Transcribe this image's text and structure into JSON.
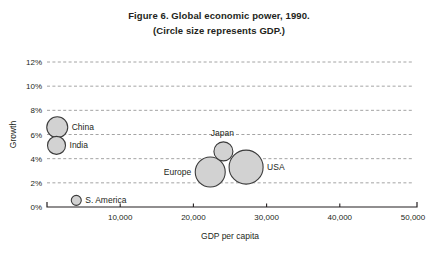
{
  "figure": {
    "title_line1": "Figure 6. Global economic power, 1990.",
    "title_line2": "(Circle size represents GDP.)"
  },
  "chart_data": {
    "type": "scatter",
    "title": "Figure 6. Global economic power, 1990. (Circle size represents GDP.)",
    "xlabel": "GDP per capita",
    "ylabel": "Growth",
    "xlim": [
      0,
      50000
    ],
    "ylim": [
      0,
      12
    ],
    "xticks": [
      0,
      10000,
      20000,
      30000,
      40000,
      50000
    ],
    "xtick_labels": [
      "",
      "10,000",
      "20,000",
      "30,000",
      "40,000",
      "50,000"
    ],
    "yticks": [
      0,
      2,
      4,
      6,
      8,
      10,
      12
    ],
    "ytick_labels": [
      "0%",
      "2%",
      "4%",
      "6%",
      "8%",
      "10%",
      "12%"
    ],
    "grid": "horizontal-dashed",
    "legend": "none",
    "size_meaning": "Circle size represents GDP",
    "points": [
      {
        "name": "China",
        "x": 1400,
        "y": 6.6,
        "size": 10.5,
        "label_pos": "right"
      },
      {
        "name": "India",
        "x": 1300,
        "y": 5.1,
        "size": 9.0,
        "label_pos": "right"
      },
      {
        "name": "S. America",
        "x": 4000,
        "y": 0.55,
        "size": 5.0,
        "label_pos": "right"
      },
      {
        "name": "Europe",
        "x": 22300,
        "y": 2.9,
        "size": 15.0,
        "label_pos": "left"
      },
      {
        "name": "Japan",
        "x": 24100,
        "y": 4.6,
        "size": 9.5,
        "label_pos": "above"
      },
      {
        "name": "USA",
        "x": 27200,
        "y": 3.3,
        "size": 17.0,
        "label_pos": "right"
      }
    ]
  },
  "colors": {
    "bubble_fill": "#d2d2d2",
    "bubble_stroke": "#3b3b3b",
    "gridline": "#9a9a9a",
    "axis": "#231f20",
    "background": "#ffffff"
  }
}
